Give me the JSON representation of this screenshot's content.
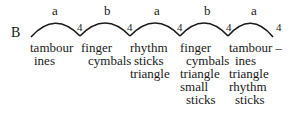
{
  "section_label": "B",
  "arcs": [
    {
      "letter": "a",
      "count": "4"
    },
    {
      "letter": "b",
      "count": "4"
    },
    {
      "letter": "a",
      "count": "4"
    },
    {
      "letter": "b",
      "count": "4"
    },
    {
      "letter": "a",
      "count": "4"
    }
  ],
  "columns": [
    {
      "lines": [
        "tambour",
        "ines"
      ]
    },
    {
      "lines": [
        "finger",
        "cymbals"
      ]
    },
    {
      "lines": [
        "rhythm",
        "sticks",
        "triangle"
      ]
    },
    {
      "lines": [
        "finger",
        "cymbals",
        "triangle",
        "small",
        "sticks"
      ]
    },
    {
      "lines": [
        "tambour –",
        "ines",
        "triangle",
        "rhythm",
        "sticks"
      ]
    }
  ]
}
